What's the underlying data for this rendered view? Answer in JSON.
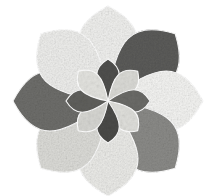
{
  "artwork": {
    "title": "Eight-Petal Rosette Mandala",
    "medium_look": "watercolor-charcoal-grayscale",
    "background_color": "#ffffff",
    "canvas": {
      "width": 217,
      "height": 196
    },
    "center": {
      "x": 108,
      "y": 101
    },
    "stroke_color": "#ffffff",
    "stroke_width": 1.1,
    "outer_rosette": {
      "name": "outer-petal-ring",
      "petal_count": 8,
      "petal_length": 95,
      "petal_half_width": 40,
      "petals": [
        {
          "index": 0,
          "angle_deg": -90,
          "position": "top",
          "fill": "#f0f0ee",
          "tone": "very-light",
          "value_pct": 94
        },
        {
          "index": 1,
          "angle_deg": -45,
          "position": "top-right",
          "fill": "#5c5c5a",
          "tone": "dark",
          "value_pct": 36
        },
        {
          "index": 2,
          "angle_deg": 0,
          "position": "right",
          "fill": "#f4f4f2",
          "tone": "very-light",
          "value_pct": 96
        },
        {
          "index": 3,
          "angle_deg": 45,
          "position": "bottom-right",
          "fill": "#8b8b88",
          "tone": "medium-dark",
          "value_pct": 55
        },
        {
          "index": 4,
          "angle_deg": 90,
          "position": "bottom",
          "fill": "#ebebe8",
          "tone": "light",
          "value_pct": 92
        },
        {
          "index": 5,
          "angle_deg": 135,
          "position": "bottom-left",
          "fill": "#dcdcd8",
          "tone": "light",
          "value_pct": 86
        },
        {
          "index": 6,
          "angle_deg": 180,
          "position": "left",
          "fill": "#6e6e6b",
          "tone": "dark",
          "value_pct": 43
        },
        {
          "index": 7,
          "angle_deg": -135,
          "position": "top-left",
          "fill": "#eeeeec",
          "tone": "very-light",
          "value_pct": 93
        }
      ]
    },
    "inner_rosette": {
      "name": "inner-petal-ring",
      "petal_count": 8,
      "petal_length": 42,
      "petal_half_width": 15,
      "petals": [
        {
          "index": 0,
          "angle_deg": -90,
          "position": "top",
          "fill": "#4f4f4d",
          "tone": "dark",
          "value_pct": 31
        },
        {
          "index": 1,
          "angle_deg": -45,
          "position": "top-right",
          "fill": "#d9d9d5",
          "tone": "light",
          "value_pct": 85
        },
        {
          "index": 2,
          "angle_deg": 0,
          "position": "right",
          "fill": "#6a6a67",
          "tone": "dark",
          "value_pct": 41
        },
        {
          "index": 3,
          "angle_deg": 45,
          "position": "bottom-right",
          "fill": "#dedeDA",
          "tone": "light",
          "value_pct": 87
        },
        {
          "index": 4,
          "angle_deg": 90,
          "position": "bottom",
          "fill": "#4a4a48",
          "tone": "dark",
          "value_pct": 29
        },
        {
          "index": 5,
          "angle_deg": 135,
          "position": "bottom-left",
          "fill": "#d5d5d1",
          "tone": "light",
          "value_pct": 83
        },
        {
          "index": 6,
          "angle_deg": 180,
          "position": "left",
          "fill": "#5f5f5c",
          "tone": "dark",
          "value_pct": 37
        },
        {
          "index": 7,
          "angle_deg": -135,
          "position": "top-left",
          "fill": "#e2e2de",
          "tone": "light",
          "value_pct": 88
        }
      ]
    },
    "texture": {
      "name": "paper-grain-mottle",
      "type": "fractal-noise",
      "base_frequency": 0.62,
      "octaves": 4,
      "opacity": 0.42
    },
    "palette": {
      "darkest": "#4a4a48",
      "dark": "#5c5c5a",
      "mid_dark": "#6e6e6b",
      "mid": "#8b8b88",
      "light": "#dcdcd8",
      "lightest": "#f4f4f2",
      "paper": "#ffffff"
    }
  }
}
